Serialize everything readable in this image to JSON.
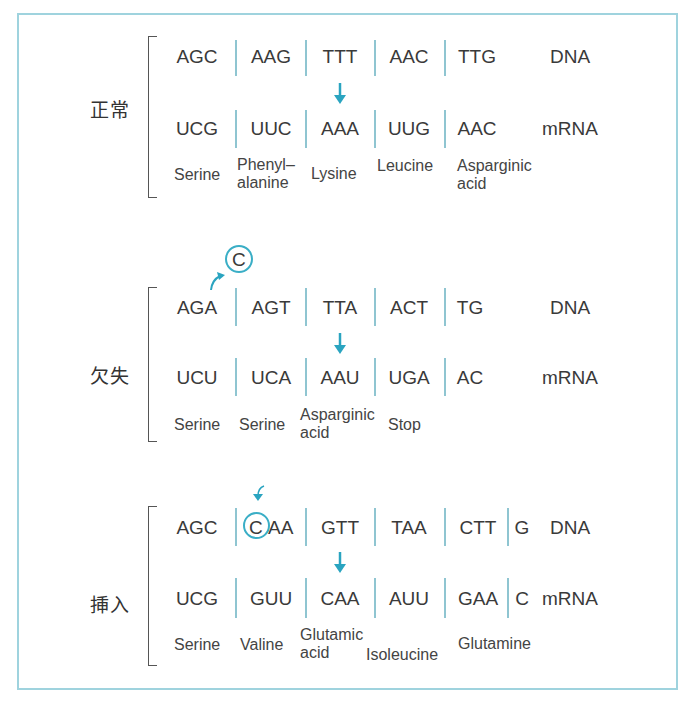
{
  "accent_color": "#2aa4c0",
  "sections": [
    {
      "label": "正常",
      "dna": [
        "AGC",
        "AAG",
        "TTT",
        "AAC",
        "TTG"
      ],
      "dna_tag": "DNA",
      "mrna": [
        "UCG",
        "UUC",
        "AAA",
        "UUG",
        "AAC"
      ],
      "mrna_tag": "mRNA",
      "amino_acids": [
        "Serine",
        "Phenyl–\nalanine",
        "Lysine",
        "Leucine",
        "Asparginic\nacid"
      ]
    },
    {
      "label": "欠失",
      "deleted_base": "C",
      "dna": [
        "AGA",
        "AGT",
        "TTA",
        "ACT",
        "TG"
      ],
      "dna_tag": "DNA",
      "mrna": [
        "UCU",
        "UCA",
        "AAU",
        "UGA",
        "AC"
      ],
      "mrna_tag": "mRNA",
      "amino_acids": [
        "Serine",
        "Serine",
        "Asparginic\nacid",
        "Stop"
      ]
    },
    {
      "label": "挿入",
      "inserted_base": "C",
      "dna": [
        "AGC",
        "AA",
        "GTT",
        "TAA",
        "CTT",
        "G"
      ],
      "dna_tag": "DNA",
      "mrna": [
        "UCG",
        "GUU",
        "CAA",
        "AUU",
        "GAA",
        "C"
      ],
      "mrna_tag": "mRNA",
      "amino_acids": [
        "Serine",
        "Valine",
        "Glutamic\nacid",
        "Isoleucine",
        "Glutamine"
      ]
    }
  ]
}
